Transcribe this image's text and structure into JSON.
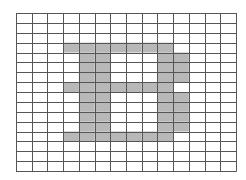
{
  "diagram": {
    "type": "pixel-grid",
    "letter": "B",
    "columns": 14,
    "rows": 16,
    "colors": {
      "background": "#ffffff",
      "fill": "#b8b8b8",
      "grid_line": "#555555",
      "border": "#666666"
    },
    "filled_cells": [
      [
        3,
        3
      ],
      [
        3,
        4
      ],
      [
        3,
        5
      ],
      [
        3,
        6
      ],
      [
        3,
        7
      ],
      [
        3,
        8
      ],
      [
        3,
        9
      ],
      [
        4,
        4
      ],
      [
        4,
        5
      ],
      [
        4,
        9
      ],
      [
        4,
        10
      ],
      [
        5,
        4
      ],
      [
        5,
        5
      ],
      [
        5,
        9
      ],
      [
        5,
        10
      ],
      [
        6,
        4
      ],
      [
        6,
        5
      ],
      [
        6,
        9
      ],
      [
        6,
        10
      ],
      [
        7,
        3
      ],
      [
        7,
        4
      ],
      [
        7,
        5
      ],
      [
        7,
        6
      ],
      [
        7,
        7
      ],
      [
        7,
        8
      ],
      [
        7,
        9
      ],
      [
        8,
        4
      ],
      [
        8,
        5
      ],
      [
        8,
        9
      ],
      [
        8,
        10
      ],
      [
        9,
        4
      ],
      [
        9,
        5
      ],
      [
        9,
        9
      ],
      [
        9,
        10
      ],
      [
        10,
        4
      ],
      [
        10,
        5
      ],
      [
        10,
        9
      ],
      [
        10,
        10
      ],
      [
        11,
        4
      ],
      [
        11,
        5
      ],
      [
        11,
        9
      ],
      [
        11,
        10
      ],
      [
        12,
        3
      ],
      [
        12,
        4
      ],
      [
        12,
        5
      ],
      [
        12,
        6
      ],
      [
        12,
        7
      ],
      [
        12,
        8
      ],
      [
        12,
        9
      ]
    ]
  }
}
